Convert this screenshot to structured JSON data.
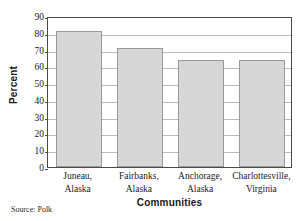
{
  "chart_data": {
    "type": "bar",
    "title": "",
    "subtitle": "",
    "xlabel": "Communities",
    "ylabel": "Percent",
    "categories": [
      "Juneau, Alaska",
      "Fairbanks, Alaska",
      "Anchorage, Alaska",
      "Charlottesville, Virginia"
    ],
    "category_lines": [
      [
        "Juneau,",
        "Alaska"
      ],
      [
        "Fairbanks,",
        "Alaska"
      ],
      [
        "Anchorage,",
        "Alaska"
      ],
      [
        "Charlottesville,",
        "Virginia"
      ]
    ],
    "values": [
      81,
      71,
      64,
      64
    ],
    "ylim": [
      0,
      90
    ],
    "ytick_values": [
      0,
      10,
      20,
      30,
      40,
      50,
      60,
      70,
      80,
      90
    ],
    "ytick_labels": [
      "0",
      "10",
      "20",
      "30",
      "40",
      "50",
      "60",
      "70",
      "80",
      "90"
    ],
    "grid": true,
    "legend": false,
    "legend_position": "none",
    "bar_fill_color": "#d7d7d7",
    "bar_border_color": "#9a9a9a",
    "grid_color": "#b9b9b9",
    "frame_color": "#4a4a4a"
  },
  "source_note": "Source: Polk"
}
